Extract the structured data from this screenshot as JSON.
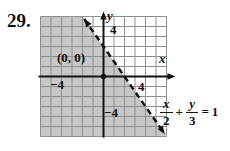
{
  "problem_number": "29.",
  "colors": {
    "background": "#ffffff",
    "shade": "#c7c7c7",
    "grid_line": "#8f8f8f",
    "ink": "#111111"
  },
  "chart_data": {
    "type": "line",
    "equation": {
      "numerator_1": "x",
      "denominator_1": "2",
      "plus_sign": "+",
      "numerator_2": "y",
      "denominator_2": "3",
      "equals_sign": "=",
      "right_side": "1"
    },
    "boundary_line": {
      "style": "dashed",
      "x_intercept": 2,
      "y_intercept": 3,
      "slope": -1.5,
      "points_on_line": [
        [
          0,
          3
        ],
        [
          2,
          0
        ]
      ]
    },
    "shaded_region": "origin side of the dashed boundary (x/2 + y/3 < 1)",
    "test_point": {
      "x": 0,
      "y": 0,
      "label": "(0, 0)"
    },
    "axes": {
      "xlabel": "x",
      "ylabel": "y",
      "xlim": [
        -6,
        6
      ],
      "ylim": [
        -6,
        6
      ],
      "grid": true,
      "x_tick_labels": [
        {
          "value": -4,
          "label": "−4"
        },
        {
          "value": 4,
          "label": "4"
        }
      ],
      "y_tick_labels": [
        {
          "value": 4,
          "label": "4"
        },
        {
          "value": -4,
          "label": "−4"
        }
      ]
    }
  }
}
